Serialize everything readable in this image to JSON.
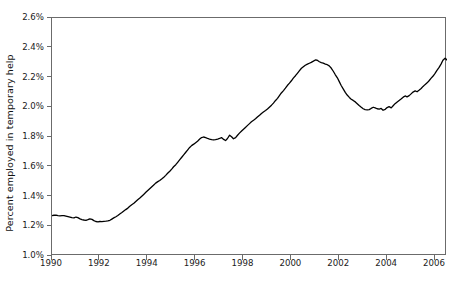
{
  "chart_data": {
    "type": "line",
    "title": "",
    "xlabel": "",
    "ylabel": "Percent employed in temporary help",
    "xlim": [
      1990.0,
      2006.5
    ],
    "ylim": [
      1.0,
      2.6
    ],
    "grid": false,
    "legend": null,
    "yticks": [
      "1.0%",
      "1.2%",
      "1.4%",
      "1.6%",
      "1.8%",
      "2.0%",
      "2.2%",
      "2.4%",
      "2.6%"
    ],
    "ytick_values": [
      1.0,
      1.2,
      1.4,
      1.6,
      1.8,
      2.0,
      2.2,
      2.4,
      2.6
    ],
    "xticks": [
      "1990",
      "1992",
      "1994",
      "1996",
      "1998",
      "2000",
      "2002",
      "2004",
      "2006"
    ],
    "xtick_values": [
      1990,
      1992,
      1994,
      1996,
      1998,
      2000,
      2002,
      2004,
      2006
    ],
    "line_color": "#000000",
    "line_width": 1.3,
    "series": [
      {
        "name": "Percent employed in temporary help",
        "x": [
          1990.0,
          1990.08,
          1990.17,
          1990.25,
          1990.33,
          1990.42,
          1990.5,
          1990.58,
          1990.67,
          1990.75,
          1990.83,
          1990.92,
          1991.0,
          1991.08,
          1991.17,
          1991.25,
          1991.33,
          1991.42,
          1991.5,
          1991.58,
          1991.67,
          1991.75,
          1991.83,
          1991.92,
          1992.0,
          1992.08,
          1992.17,
          1992.25,
          1992.33,
          1992.42,
          1992.5,
          1992.58,
          1992.67,
          1992.75,
          1992.83,
          1992.92,
          1993.0,
          1993.08,
          1993.17,
          1993.25,
          1993.33,
          1993.42,
          1993.5,
          1993.58,
          1993.67,
          1993.75,
          1993.83,
          1993.92,
          1994.0,
          1994.08,
          1994.17,
          1994.25,
          1994.33,
          1994.42,
          1994.5,
          1994.58,
          1994.67,
          1994.75,
          1994.83,
          1994.92,
          1995.0,
          1995.08,
          1995.17,
          1995.25,
          1995.33,
          1995.42,
          1995.5,
          1995.58,
          1995.67,
          1995.75,
          1995.83,
          1995.92,
          1996.0,
          1996.08,
          1996.17,
          1996.25,
          1996.33,
          1996.42,
          1996.5,
          1996.58,
          1996.67,
          1996.75,
          1996.83,
          1996.92,
          1997.0,
          1997.08,
          1997.17,
          1997.25,
          1997.33,
          1997.42,
          1997.5,
          1997.58,
          1997.67,
          1997.75,
          1997.83,
          1997.92,
          1998.0,
          1998.08,
          1998.17,
          1998.25,
          1998.33,
          1998.42,
          1998.5,
          1998.58,
          1998.67,
          1998.75,
          1998.83,
          1998.92,
          1999.0,
          1999.08,
          1999.17,
          1999.25,
          1999.33,
          1999.42,
          1999.5,
          1999.58,
          1999.67,
          1999.75,
          1999.83,
          1999.92,
          2000.0,
          2000.08,
          2000.17,
          2000.25,
          2000.33,
          2000.42,
          2000.5,
          2000.58,
          2000.67,
          2000.75,
          2000.83,
          2000.92,
          2001.0,
          2001.08,
          2001.17,
          2001.25,
          2001.33,
          2001.42,
          2001.5,
          2001.58,
          2001.67,
          2001.75,
          2001.83,
          2001.92,
          2002.0,
          2002.08,
          2002.17,
          2002.25,
          2002.33,
          2002.42,
          2002.5,
          2002.58,
          2002.67,
          2002.75,
          2002.83,
          2002.92,
          2003.0,
          2003.08,
          2003.17,
          2003.25,
          2003.33,
          2003.42,
          2003.5,
          2003.58,
          2003.67,
          2003.75,
          2003.83,
          2003.92,
          2004.0,
          2004.08,
          2004.17,
          2004.25,
          2004.33,
          2004.42,
          2004.5,
          2004.58,
          2004.67,
          2004.75,
          2004.83,
          2004.92,
          2005.0,
          2005.08,
          2005.17,
          2005.25,
          2005.33,
          2005.42,
          2005.5,
          2005.58,
          2005.67,
          2005.75,
          2005.83,
          2005.92,
          2006.0,
          2006.08,
          2006.17,
          2006.25,
          2006.33,
          2006.42,
          2006.5
        ],
        "y": [
          1.272,
          1.274,
          1.275,
          1.272,
          1.27,
          1.272,
          1.271,
          1.268,
          1.265,
          1.262,
          1.258,
          1.256,
          1.262,
          1.258,
          1.25,
          1.245,
          1.242,
          1.24,
          1.244,
          1.25,
          1.246,
          1.238,
          1.232,
          1.23,
          1.232,
          1.231,
          1.233,
          1.234,
          1.236,
          1.24,
          1.248,
          1.256,
          1.264,
          1.272,
          1.282,
          1.292,
          1.302,
          1.312,
          1.322,
          1.334,
          1.344,
          1.354,
          1.366,
          1.378,
          1.39,
          1.402,
          1.414,
          1.428,
          1.44,
          1.452,
          1.466,
          1.478,
          1.49,
          1.5,
          1.508,
          1.518,
          1.53,
          1.542,
          1.556,
          1.57,
          1.584,
          1.6,
          1.614,
          1.63,
          1.646,
          1.664,
          1.68,
          1.696,
          1.714,
          1.73,
          1.742,
          1.752,
          1.762,
          1.772,
          1.786,
          1.796,
          1.8,
          1.796,
          1.79,
          1.786,
          1.782,
          1.78,
          1.782,
          1.786,
          1.79,
          1.796,
          1.784,
          1.776,
          1.79,
          1.812,
          1.802,
          1.788,
          1.796,
          1.812,
          1.826,
          1.84,
          1.852,
          1.864,
          1.878,
          1.89,
          1.902,
          1.912,
          1.922,
          1.934,
          1.946,
          1.958,
          1.968,
          1.978,
          1.988,
          2.0,
          2.014,
          2.028,
          2.044,
          2.06,
          2.078,
          2.096,
          2.112,
          2.128,
          2.146,
          2.162,
          2.178,
          2.196,
          2.212,
          2.228,
          2.244,
          2.262,
          2.272,
          2.282,
          2.29,
          2.296,
          2.302,
          2.31,
          2.318,
          2.316,
          2.306,
          2.3,
          2.296,
          2.29,
          2.286,
          2.278,
          2.262,
          2.242,
          2.22,
          2.198,
          2.172,
          2.146,
          2.122,
          2.1,
          2.082,
          2.066,
          2.054,
          2.046,
          2.036,
          2.024,
          2.012,
          2.0,
          1.99,
          1.984,
          1.982,
          1.984,
          1.992,
          2.0,
          1.996,
          1.99,
          1.988,
          1.992,
          1.98,
          1.986,
          1.998,
          2.004,
          1.996,
          2.01,
          2.024,
          2.036,
          2.046,
          2.056,
          2.068,
          2.076,
          2.07,
          2.078,
          2.09,
          2.102,
          2.11,
          2.104,
          2.114,
          2.126,
          2.14,
          2.152,
          2.164,
          2.178,
          2.194,
          2.21,
          2.228,
          2.248,
          2.268,
          2.29,
          2.316,
          2.33,
          2.318
        ]
      }
    ],
    "annotations": {
      "start_value": "1.27%",
      "trough_1991": "1.23%",
      "peak_2001": "2.32%",
      "trough_2003": "1.98%",
      "end_value": "2.32%"
    }
  }
}
